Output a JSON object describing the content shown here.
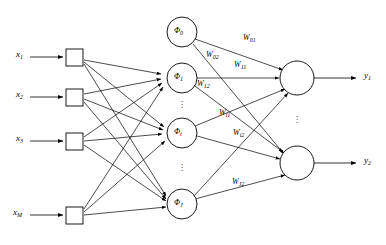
{
  "figure": {
    "title": "",
    "type": "neural-network-architecture-diagram"
  },
  "layers": {
    "input": {
      "name": "input-layer",
      "nodes": [
        {
          "id": "x1",
          "label": "x",
          "sub": "1",
          "cx": 72,
          "cy": 57
        },
        {
          "id": "x2",
          "label": "x",
          "sub": "2",
          "cx": 72,
          "cy": 97
        },
        {
          "id": "x3",
          "label": "x",
          "sub": "3",
          "cx": 72,
          "cy": 141
        },
        {
          "id": "xM",
          "label": "x",
          "sub": "M",
          "cx": 72,
          "cy": 215
        }
      ],
      "labels": [
        {
          "id": "x1",
          "text": "x",
          "sub": "1",
          "x": 16,
          "y": 50
        },
        {
          "id": "x2",
          "text": "x",
          "sub": "2",
          "x": 16,
          "y": 90
        },
        {
          "id": "x3",
          "text": "x",
          "sub": "3",
          "x": 16,
          "y": 134
        },
        {
          "id": "xM",
          "text": "x",
          "sub": "M",
          "x": 14,
          "y": 208
        }
      ]
    },
    "hidden": {
      "name": "hidden-layer",
      "nodes": [
        {
          "id": "phi0",
          "label": "Φ",
          "sub": "0",
          "cx": 182,
          "cy": 32,
          "r": 15
        },
        {
          "id": "phi1",
          "label": "Φ",
          "sub": "1",
          "cx": 182,
          "cy": 78,
          "r": 15
        },
        {
          "id": "phii",
          "label": "Φ",
          "sub": "i",
          "cx": 182,
          "cy": 133,
          "r": 15
        },
        {
          "id": "phiJ",
          "label": "Φ",
          "sub": "J",
          "cx": 182,
          "cy": 204,
          "r": 15
        }
      ],
      "ellipses": [
        {
          "id": "dots-1",
          "x": 182,
          "y": 105
        },
        {
          "id": "dots-2",
          "x": 182,
          "y": 168
        }
      ]
    },
    "output": {
      "name": "output-layer",
      "nodes": [
        {
          "id": "o1",
          "cx": 297,
          "cy": 78,
          "r": 17
        },
        {
          "id": "o2",
          "cx": 297,
          "cy": 163,
          "r": 17
        }
      ],
      "labels": [
        {
          "id": "y1",
          "text": "y",
          "sub": "1",
          "x": 364,
          "y": 72
        },
        {
          "id": "y2",
          "text": "y",
          "sub": "2",
          "x": 364,
          "y": 157
        }
      ],
      "ellipses": [
        {
          "id": "dots-out",
          "x": 297,
          "y": 120
        }
      ]
    }
  },
  "weights": [
    {
      "id": "w01",
      "text": "W",
      "sub": "01",
      "x": 243,
      "y": 39
    },
    {
      "id": "w02",
      "text": "W",
      "sub": "02",
      "x": 206,
      "y": 56
    },
    {
      "id": "w11",
      "text": "W",
      "sub": "11",
      "x": 234,
      "y": 66
    },
    {
      "id": "w12",
      "text": "W",
      "sub": "12",
      "x": 197,
      "y": 85
    },
    {
      "id": "wi1",
      "text": "W",
      "sub": "i1",
      "x": 219,
      "y": 114
    },
    {
      "id": "wi2",
      "text": "W",
      "sub": "i2",
      "x": 233,
      "y": 134
    },
    {
      "id": "wJ2",
      "text": "W",
      "sub": "J2",
      "x": 232,
      "y": 183
    }
  ],
  "style": {
    "stroke": "#000000",
    "background": "#ffffff",
    "line_width": 0.8
  }
}
